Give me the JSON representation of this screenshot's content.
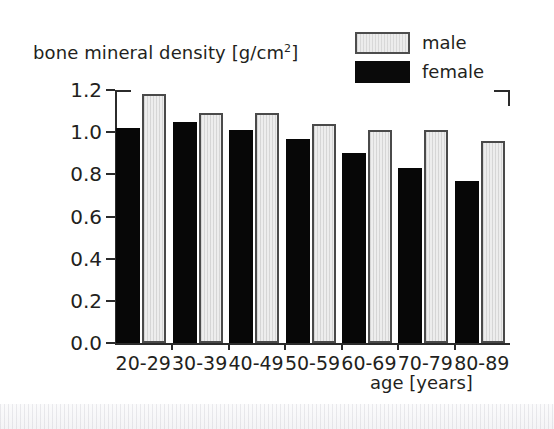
{
  "chart_data": {
    "type": "bar",
    "title": "",
    "subtitle": "",
    "ylabel": "bone mineral density [g/cm",
    "ylabel_sup": "2",
    "ylabel_suffix": "]",
    "ylabel_full": "bone mineral density [g/cm2]",
    "xlabel": "age [years]",
    "categories": [
      "20-29",
      "30-39",
      "40-49",
      "50-59",
      "60-69",
      "70-79",
      "80-89"
    ],
    "series": [
      {
        "name": "female",
        "color": "#070707",
        "values": [
          1.02,
          1.05,
          1.01,
          0.97,
          0.9,
          0.83,
          0.77
        ]
      },
      {
        "name": "male",
        "color": "#ededed",
        "values": [
          1.18,
          1.09,
          1.09,
          1.04,
          1.01,
          1.01,
          0.96
        ]
      }
    ],
    "ylim": [
      0.0,
      1.2
    ],
    "ytick_labels": [
      "0.0",
      "0.2",
      "0.4",
      "0.6",
      "0.8",
      "1.0",
      "1.2"
    ],
    "ytick_values": [
      0.0,
      0.2,
      0.4,
      0.6,
      0.8,
      1.0,
      1.2
    ],
    "grid": false,
    "legend_position": "top-right",
    "bar_order_in_group": [
      "female",
      "male"
    ]
  },
  "legend": {
    "entries": [
      {
        "label": "male",
        "swatch": "male-swatch",
        "color": "#ededed"
      },
      {
        "label": "female",
        "swatch": "female-swatch",
        "color": "#070707"
      }
    ]
  }
}
